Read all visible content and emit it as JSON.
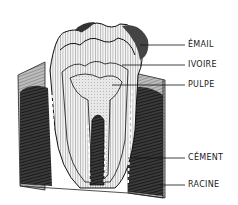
{
  "diagram": {
    "labels": [
      {
        "text": "ÉMAIL",
        "y": 45
      },
      {
        "text": "IVOIRE",
        "y": 65
      },
      {
        "text": "PULPE",
        "y": 85
      },
      {
        "text": "CÉMENT",
        "y": 158
      },
      {
        "text": "RACINE",
        "y": 185
      }
    ]
  }
}
